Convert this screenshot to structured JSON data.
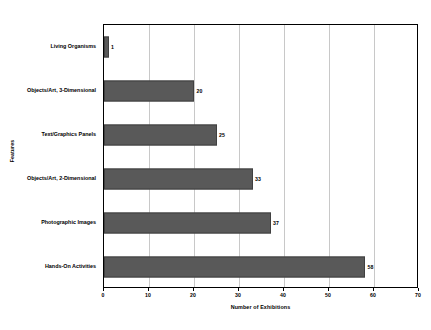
{
  "chart_data": {
    "type": "bar",
    "orientation": "horizontal",
    "title": "",
    "xlabel": "Number of Exhibitions",
    "ylabel": "Features",
    "xlim": [
      0,
      70
    ],
    "xticks": [
      0,
      10,
      20,
      30,
      40,
      50,
      60,
      70
    ],
    "grid": true,
    "legend": "none",
    "categories": [
      "Living Organisms",
      "Objects/Art, 3-Dimensional",
      "Text/Graphics Panels",
      "Objects/Art, 2-Dimensional",
      "Photographic Images",
      "Hands-On Activities"
    ],
    "values": [
      1,
      20,
      25,
      33,
      37,
      58
    ],
    "data_labels": [
      "1",
      "20",
      "25",
      "33",
      "37",
      "58"
    ],
    "bar_color": "#595959",
    "bar_border_color": "#404040",
    "gridline_color": "#c8c8c8",
    "axis_color": "#000000",
    "background_color": "#ffffff"
  }
}
